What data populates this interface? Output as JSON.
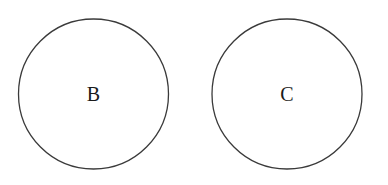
{
  "diagram": {
    "type": "two separate circles (disjoint sets)",
    "nodes": [
      {
        "id": "B",
        "label": "B",
        "cx": 93.5,
        "cy": 94,
        "r": 75
      },
      {
        "id": "C",
        "label": "C",
        "cx": 287,
        "cy": 94,
        "r": 75
      }
    ],
    "colors": {
      "stroke": "#3a3a3a",
      "text": "#1a1a1a",
      "background": "#ffffff"
    }
  }
}
